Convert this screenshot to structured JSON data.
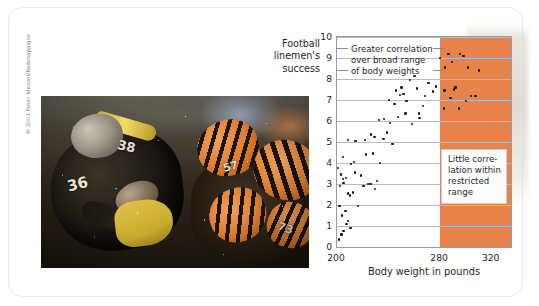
{
  "photo": {
    "credit": "© 2003 Peter Menzel/Redsnapaigns",
    "alt_name": "football-linemen-photo",
    "steelers_number": "38",
    "steelers_number_2": "36",
    "bengals_number": "57",
    "bengals_number_2": "73"
  },
  "chart_data": {
    "type": "scatter",
    "title": "",
    "ylabel": "Football\nlinemen's\nsuccess",
    "xlabel": "Body weight in pounds",
    "ylabel_lines": [
      "Football",
      "linemen's",
      "success"
    ],
    "xlim": [
      200,
      335
    ],
    "ylim": [
      0,
      10
    ],
    "yticks": [
      0,
      1,
      2,
      3,
      4,
      5,
      6,
      7,
      8,
      9,
      10
    ],
    "xticks": [
      200,
      280,
      320
    ],
    "grid": "horizontal",
    "legend": "none",
    "highlight_band": {
      "label": "restricted range",
      "x_start": 280,
      "x_end": 335,
      "color": "#e8834b"
    },
    "annotations": [
      {
        "name": "greater-correlation",
        "text": "Greater correlation\nover broad range\nof body weights"
      },
      {
        "name": "little-correlation",
        "text": "Little corre-\nlation within\nrestricted\nrange"
      }
    ],
    "points": [
      [
        201.5,
        0.35
      ],
      [
        203.5,
        0.6
      ],
      [
        205.0,
        0.75
      ],
      [
        207.5,
        1.1
      ],
      [
        208.5,
        1.25
      ],
      [
        210.5,
        0.9
      ],
      [
        202.0,
        1.95
      ],
      [
        204.0,
        1.5
      ],
      [
        206.5,
        1.7
      ],
      [
        202.5,
        2.9
      ],
      [
        205.0,
        3.05
      ],
      [
        208.5,
        2.55
      ],
      [
        210.0,
        2.45
      ],
      [
        212.5,
        2.6
      ],
      [
        216.5,
        1.95
      ],
      [
        220.5,
        2.9
      ],
      [
        226.0,
        3.0
      ],
      [
        229.5,
        2.75
      ],
      [
        201.0,
        3.75
      ],
      [
        203.0,
        3.45
      ],
      [
        204.5,
        3.25
      ],
      [
        207.0,
        3.3
      ],
      [
        211.0,
        3.95
      ],
      [
        214.0,
        3.55
      ],
      [
        218.5,
        3.4
      ],
      [
        224.0,
        3.0
      ],
      [
        231.0,
        3.15
      ],
      [
        204.5,
        4.3
      ],
      [
        213.0,
        4.05
      ],
      [
        222.5,
        4.4
      ],
      [
        228.0,
        4.45
      ],
      [
        233.5,
        4.0
      ],
      [
        208.5,
        5.1
      ],
      [
        214.5,
        5.05
      ],
      [
        221.5,
        5.1
      ],
      [
        226.5,
        5.35
      ],
      [
        229.0,
        5.25
      ],
      [
        236.0,
        5.15
      ],
      [
        239.0,
        5.45
      ],
      [
        243.0,
        4.9
      ],
      [
        232.5,
        6.05
      ],
      [
        236.5,
        6.1
      ],
      [
        241.0,
        5.9
      ],
      [
        247.5,
        6.2
      ],
      [
        253.0,
        6.35
      ],
      [
        258.0,
        5.85
      ],
      [
        240.5,
        7.0
      ],
      [
        244.5,
        6.8
      ],
      [
        249.0,
        7.25
      ],
      [
        251.5,
        7.3
      ],
      [
        254.0,
        6.95
      ],
      [
        246.0,
        7.45
      ],
      [
        250.0,
        7.6
      ],
      [
        256.5,
        7.95
      ],
      [
        260.0,
        8.15
      ],
      [
        262.0,
        7.55
      ],
      [
        263.5,
        6.35
      ],
      [
        264.0,
        6.15
      ],
      [
        266.5,
        6.7
      ],
      [
        268.5,
        7.2
      ],
      [
        271.0,
        7.8
      ],
      [
        274.5,
        7.4
      ],
      [
        277.0,
        7.65
      ],
      [
        280.0,
        9.0
      ],
      [
        284.0,
        8.55
      ],
      [
        286.5,
        9.2
      ],
      [
        289.0,
        8.8
      ],
      [
        292.0,
        7.6
      ],
      [
        295.5,
        9.2
      ],
      [
        298.0,
        9.1
      ],
      [
        301.5,
        8.55
      ],
      [
        304.0,
        7.2
      ],
      [
        307.5,
        7.2
      ],
      [
        310.0,
        8.4
      ],
      [
        283.5,
        7.45
      ],
      [
        288.0,
        7.1
      ],
      [
        291.0,
        7.5
      ],
      [
        294.5,
        6.6
      ],
      [
        300.0,
        6.95
      ],
      [
        283.0,
        6.6
      ]
    ]
  }
}
